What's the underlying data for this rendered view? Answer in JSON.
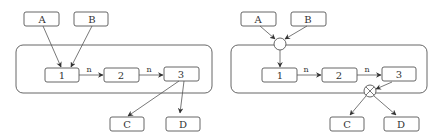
{
  "diagrams": [
    {
      "id": "left",
      "nodes": [
        {
          "key": "A",
          "label": "A"
        },
        {
          "key": "B",
          "label": "B"
        },
        {
          "key": "1",
          "label": "1"
        },
        {
          "key": "2",
          "label": "2"
        },
        {
          "key": "3",
          "label": "3"
        },
        {
          "key": "C",
          "label": "C"
        },
        {
          "key": "D",
          "label": "D"
        }
      ],
      "edges": [
        {
          "from": "A",
          "to": "1",
          "label": ""
        },
        {
          "from": "B",
          "to": "1",
          "label": ""
        },
        {
          "from": "1",
          "to": "2",
          "label": "n"
        },
        {
          "from": "2",
          "to": "3",
          "label": "n"
        },
        {
          "from": "3",
          "to": "C",
          "label": ""
        },
        {
          "from": "3",
          "to": "D",
          "label": ""
        }
      ]
    },
    {
      "id": "right",
      "nodes": [
        {
          "key": "A",
          "label": "A"
        },
        {
          "key": "B",
          "label": "B"
        },
        {
          "key": "1",
          "label": "1"
        },
        {
          "key": "2",
          "label": "2"
        },
        {
          "key": "3",
          "label": "3"
        },
        {
          "key": "C",
          "label": "C"
        },
        {
          "key": "D",
          "label": "D"
        }
      ],
      "junctions": [
        {
          "key": "join",
          "type": "merge-circle"
        },
        {
          "key": "split",
          "type": "xor-circle"
        }
      ],
      "edges": [
        {
          "from": "A",
          "to": "join",
          "label": ""
        },
        {
          "from": "B",
          "to": "join",
          "label": ""
        },
        {
          "from": "join",
          "to": "1",
          "label": ""
        },
        {
          "from": "1",
          "to": "2",
          "label": "n"
        },
        {
          "from": "2",
          "to": "3",
          "label": "n"
        },
        {
          "from": "3",
          "to": "split",
          "label": ""
        },
        {
          "from": "split",
          "to": "C",
          "label": ""
        },
        {
          "from": "split",
          "to": "D",
          "label": ""
        }
      ]
    }
  ]
}
